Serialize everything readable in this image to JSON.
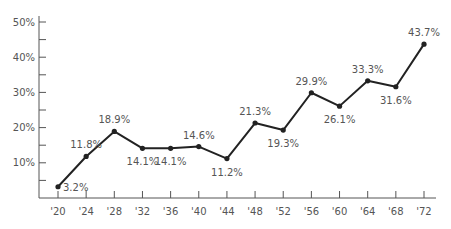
{
  "chart_data": {
    "type": "line",
    "title": "",
    "xlabel": "",
    "ylabel": "",
    "categories": [
      "'20",
      "'24",
      "'28",
      "'32",
      "'36",
      "'40",
      "'44",
      "'48",
      "'52",
      "'56",
      "'60",
      "'64",
      "'68",
      "'72"
    ],
    "values": [
      3.2,
      11.8,
      18.9,
      14.1,
      14.1,
      14.6,
      11.2,
      21.3,
      19.3,
      29.9,
      26.1,
      33.3,
      31.6,
      43.7
    ],
    "data_labels": [
      "3.2%",
      "11.8%",
      "18.9%",
      "14.1%",
      "14.1%",
      "14.6%",
      "11.2%",
      "21.3%",
      "19.3%",
      "29.9%",
      "26.1%",
      "33.3%",
      "31.6%",
      "43.7%"
    ],
    "label_positions": [
      "right",
      "above",
      "above",
      "below",
      "below",
      "above",
      "below",
      "above",
      "below",
      "above",
      "below",
      "above",
      "below",
      "above"
    ],
    "y_ticks": [
      "10%",
      "20%",
      "30%",
      "40%",
      "50%"
    ],
    "ylim": [
      0,
      50
    ],
    "grid": false,
    "legend": null,
    "line_color": "#222222",
    "text_color": "#555555",
    "axis_color": "#555555"
  }
}
